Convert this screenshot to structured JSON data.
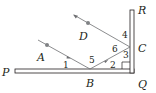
{
  "figure": {
    "colors": {
      "stroke": "#231f20",
      "ray": "#6d6e71",
      "dot": "#808285",
      "background": "#ffffff"
    }
  },
  "points": {
    "P": "P",
    "Q": "Q",
    "R": "R",
    "A": "A",
    "B": "B",
    "C": "C",
    "D": "D"
  },
  "angles": {
    "a1": "1",
    "a2": "2",
    "a3": "3",
    "a4": "4",
    "a5": "5",
    "a6": "6"
  }
}
